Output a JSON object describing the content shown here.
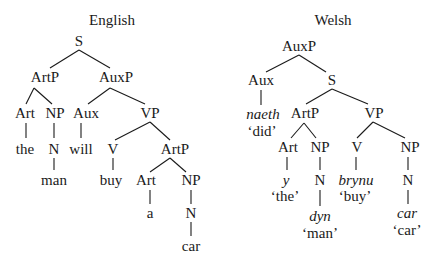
{
  "trees": [
    {
      "title": "English",
      "nodes": {
        "S": "S",
        "ArtP1": "ArtP",
        "AuxP": "AuxP",
        "Art1": "Art",
        "NP1": "NP",
        "Aux": "Aux",
        "VP": "VP",
        "the": "the",
        "N1": "N",
        "will": "will",
        "V": "V",
        "ArtP2": "ArtP",
        "man": "man",
        "buy": "buy",
        "Art2": "Art",
        "NP2": "NP",
        "a": "a",
        "N2": "N",
        "car": "car"
      }
    },
    {
      "title": "Welsh",
      "nodes": {
        "AuxP": "AuxP",
        "Aux": "Aux",
        "S": "S",
        "naeth": "naeth",
        "naeth_gloss": "‘did’",
        "ArtP": "ArtP",
        "VP": "VP",
        "Art": "Art",
        "NP1": "NP",
        "V": "V",
        "NP2": "NP",
        "y": "y",
        "y_gloss": "‘the’",
        "N1": "N",
        "brynu": "brynu",
        "brynu_gloss": "‘buy’",
        "N2": "N",
        "dyn": "dyn",
        "dyn_gloss": "‘man’",
        "car": "car",
        "car_gloss": "‘car’"
      }
    }
  ]
}
